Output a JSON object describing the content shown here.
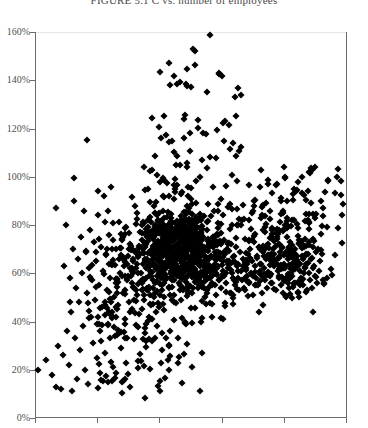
{
  "figure": {
    "title": "FIGURE 5.1  C vs. number of employees",
    "title_clipped": true
  },
  "chart_data": {
    "type": "scatter",
    "title": "FIGURE 5.1  C vs. number of employees",
    "xlabel": "",
    "ylabel": "",
    "ylim": [
      0,
      160
    ],
    "ytick_labels": [
      "0%",
      "20%",
      "40%",
      "60%",
      "80%",
      "100%",
      "120%",
      "140%",
      "160%"
    ],
    "ytick_values": [
      0,
      20,
      40,
      60,
      80,
      100,
      120,
      140,
      160
    ],
    "xtick_labels": [
      "",
      "",
      "",
      "",
      "",
      ""
    ],
    "xtick_count": 6,
    "grid": false,
    "legend": null,
    "marker": "diamond",
    "marker_color": "#000000",
    "marker_size": 5,
    "axis_color": "#6b6b6b",
    "background": "#ffffff",
    "n_points": 1180,
    "points": [
      [
        35,
        41
      ],
      [
        38,
        20
      ],
      [
        46,
        24
      ],
      [
        52,
        18
      ],
      [
        56,
        13
      ],
      [
        58,
        30
      ],
      [
        61,
        12
      ],
      [
        63,
        26
      ],
      [
        64,
        63
      ],
      [
        66,
        80
      ],
      [
        67,
        36
      ],
      [
        69,
        22
      ],
      [
        70,
        58
      ],
      [
        71,
        44
      ],
      [
        72,
        11
      ],
      [
        73,
        70
      ],
      [
        74,
        90
      ],
      [
        75,
        33
      ],
      [
        76,
        54
      ],
      [
        77,
        16
      ],
      [
        78,
        66
      ],
      [
        79,
        48
      ],
      [
        80,
        28
      ],
      [
        81,
        75
      ],
      [
        82,
        60
      ],
      [
        83,
        38
      ],
      [
        84,
        86
      ],
      [
        85,
        20
      ],
      [
        86,
        69
      ],
      [
        87,
        52
      ],
      [
        88,
        14
      ],
      [
        89,
        62
      ],
      [
        90,
        78
      ],
      [
        91,
        42
      ],
      [
        92,
        57
      ],
      [
        93,
        31
      ],
      [
        94,
        73
      ],
      [
        95,
        49
      ],
      [
        96,
        65
      ],
      [
        97,
        25
      ],
      [
        98,
        84
      ],
      [
        99,
        55
      ],
      [
        100,
        36
      ],
      [
        101,
        71
      ],
      [
        102,
        46
      ],
      [
        103,
        61
      ],
      [
        104,
        92
      ],
      [
        105,
        27
      ],
      [
        106,
        68
      ],
      [
        107,
        53
      ],
      [
        108,
        39
      ],
      [
        109,
        76
      ],
      [
        110,
        58
      ],
      [
        111,
        64
      ],
      [
        112,
        44
      ],
      [
        113,
        81
      ],
      [
        114,
        50
      ],
      [
        115,
        34
      ],
      [
        116,
        70
      ],
      [
        117,
        56
      ],
      [
        118,
        47
      ],
      [
        119,
        66
      ],
      [
        120,
        60
      ],
      [
        121,
        29
      ],
      [
        122,
        74
      ],
      [
        123,
        52
      ],
      [
        124,
        63
      ],
      [
        125,
        41
      ],
      [
        126,
        79
      ],
      [
        127,
        57
      ],
      [
        128,
        67
      ],
      [
        129,
        48
      ],
      [
        130,
        72
      ],
      [
        131,
        59
      ],
      [
        132,
        45
      ],
      [
        133,
        65
      ],
      [
        134,
        54
      ],
      [
        135,
        88
      ],
      [
        136,
        62
      ],
      [
        137,
        51
      ],
      [
        138,
        69
      ],
      [
        139,
        43
      ],
      [
        140,
        77
      ],
      [
        141,
        60
      ],
      [
        142,
        56
      ],
      [
        143,
        64
      ],
      [
        144,
        49
      ],
      [
        145,
        71
      ],
      [
        146,
        58
      ],
      [
        147,
        66
      ],
      [
        148,
        53
      ],
      [
        149,
        75
      ],
      [
        150,
        61
      ],
      [
        151,
        47
      ],
      [
        152,
        68
      ],
      [
        153,
        57
      ],
      [
        154,
        63
      ],
      [
        155,
        52
      ],
      [
        156,
        73
      ],
      [
        157,
        59
      ],
      [
        158,
        65
      ],
      [
        159,
        46
      ],
      [
        160,
        70
      ],
      [
        161,
        60
      ],
      [
        162,
        55
      ],
      [
        163,
        67
      ],
      [
        164,
        50
      ],
      [
        165,
        72
      ],
      [
        166,
        62
      ],
      [
        167,
        58
      ],
      [
        168,
        64
      ],
      [
        169,
        54
      ],
      [
        170,
        69
      ],
      [
        171,
        61
      ],
      [
        172,
        57
      ],
      [
        173,
        66
      ],
      [
        174,
        51
      ],
      [
        175,
        74
      ],
      [
        176,
        63
      ],
      [
        177,
        59
      ],
      [
        178,
        68
      ],
      [
        179,
        56
      ],
      [
        180,
        71
      ],
      [
        181,
        60
      ],
      [
        182,
        65
      ],
      [
        183,
        53
      ],
      [
        184,
        70
      ],
      [
        185,
        62
      ],
      [
        186,
        58
      ],
      [
        187,
        67
      ],
      [
        188,
        55
      ],
      [
        189,
        73
      ],
      [
        190,
        61
      ],
      [
        191,
        64
      ],
      [
        192,
        52
      ],
      [
        193,
        69
      ],
      [
        194,
        60
      ],
      [
        195,
        152
      ],
      [
        196,
        57
      ],
      [
        197,
        66
      ],
      [
        198,
        54
      ],
      [
        199,
        72
      ],
      [
        200,
        63
      ],
      [
        201,
        59
      ],
      [
        202,
        68
      ],
      [
        203,
        56
      ],
      [
        204,
        70
      ],
      [
        205,
        61
      ],
      [
        206,
        65
      ],
      [
        207,
        53
      ],
      [
        208,
        74
      ],
      [
        209,
        62
      ],
      [
        210,
        58
      ],
      [
        211,
        67
      ],
      [
        212,
        55
      ],
      [
        213,
        71
      ],
      [
        214,
        60
      ],
      [
        215,
        64
      ],
      [
        216,
        51
      ],
      [
        217,
        69
      ],
      [
        218,
        63
      ],
      [
        219,
        57
      ],
      [
        220,
        66
      ],
      [
        221,
        54
      ],
      [
        222,
        73
      ],
      [
        223,
        61
      ],
      [
        224,
        59
      ],
      [
        225,
        68
      ],
      [
        226,
        56
      ],
      [
        227,
        70
      ],
      [
        228,
        62
      ],
      [
        229,
        65
      ],
      [
        230,
        52
      ],
      [
        231,
        72
      ],
      [
        232,
        60
      ],
      [
        233,
        58
      ],
      [
        234,
        67
      ],
      [
        235,
        55
      ],
      [
        236,
        71
      ],
      [
        237,
        63
      ],
      [
        238,
        64
      ],
      [
        239,
        53
      ],
      [
        240,
        69
      ],
      [
        241,
        61
      ],
      [
        242,
        57
      ],
      [
        243,
        66
      ],
      [
        244,
        54
      ],
      [
        245,
        74
      ],
      [
        246,
        62
      ],
      [
        247,
        59
      ],
      [
        248,
        68
      ],
      [
        249,
        56
      ],
      [
        250,
        70
      ],
      [
        251,
        60
      ],
      [
        252,
        65
      ],
      [
        253,
        51
      ],
      [
        254,
        73
      ],
      [
        255,
        63
      ],
      [
        256,
        58
      ],
      [
        257,
        67
      ],
      [
        258,
        55
      ],
      [
        259,
        71
      ],
      [
        260,
        61
      ],
      [
        261,
        64
      ],
      [
        262,
        52
      ],
      [
        263,
        69
      ],
      [
        264,
        62
      ],
      [
        265,
        57
      ],
      [
        266,
        66
      ],
      [
        267,
        54
      ],
      [
        268,
        72
      ],
      [
        269,
        60
      ],
      [
        270,
        59
      ],
      [
        271,
        68
      ],
      [
        272,
        56
      ],
      [
        273,
        70
      ],
      [
        274,
        63
      ],
      [
        275,
        65
      ],
      [
        276,
        53
      ],
      [
        277,
        74
      ],
      [
        278,
        61
      ],
      [
        279,
        58
      ],
      [
        280,
        67
      ],
      [
        281,
        55
      ],
      [
        282,
        71
      ],
      [
        283,
        62
      ],
      [
        284,
        64
      ],
      [
        285,
        100
      ],
      [
        286,
        68
      ],
      [
        287,
        57
      ],
      [
        288,
        66
      ],
      [
        289,
        54
      ],
      [
        290,
        73
      ],
      [
        291,
        60
      ],
      [
        292,
        59
      ],
      [
        293,
        69
      ],
      [
        294,
        56
      ],
      [
        295,
        70
      ],
      [
        296,
        63
      ],
      [
        297,
        65
      ],
      [
        298,
        52
      ],
      [
        299,
        72
      ],
      [
        300,
        61
      ],
      [
        301,
        58
      ],
      [
        302,
        67
      ],
      [
        303,
        55
      ],
      [
        304,
        71
      ],
      [
        305,
        62
      ],
      [
        306,
        64
      ],
      [
        307,
        53
      ],
      [
        308,
        68
      ],
      [
        309,
        60
      ],
      [
        310,
        57
      ],
      [
        311,
        66
      ],
      [
        312,
        54
      ],
      [
        313,
        74
      ],
      [
        314,
        63
      ],
      [
        315,
        59
      ],
      [
        316,
        69
      ],
      [
        317,
        56
      ],
      [
        318,
        70
      ],
      [
        319,
        61
      ],
      [
        320,
        65
      ]
    ]
  }
}
